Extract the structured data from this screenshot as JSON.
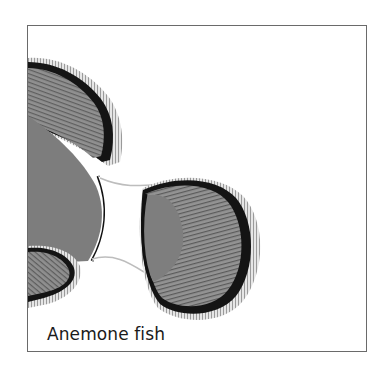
{
  "figure": {
    "caption": "Anemone fish",
    "colors": {
      "fin_gray": "#8e8e8e",
      "body_gray": "#7d7d7d",
      "band_black": "#141414",
      "fin_edge": "#dcdcdc",
      "frame_border": "#6a6a6a",
      "background": "#ffffff"
    }
  }
}
